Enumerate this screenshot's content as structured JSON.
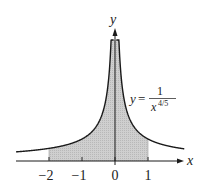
{
  "chart_data": {
    "type": "area",
    "title": "",
    "function": "y = 1/x^(4/5)",
    "equation_label": {
      "lhs": "y",
      "eq": "=",
      "numerator": "1",
      "denominator_base": "x",
      "denominator_exponent": "4/5"
    },
    "xlabel": "x",
    "ylabel": "y",
    "x_ticks": [
      -2,
      -1,
      0,
      1
    ],
    "x_tick_labels": [
      "−2",
      "−1",
      "0",
      "1"
    ],
    "shaded_interval": [
      -2,
      1
    ],
    "xlim": [
      -3,
      2.1
    ],
    "grid": false,
    "legend": "none",
    "colors": {
      "curve": "#1a1a1a",
      "fill": "#c8c8c8",
      "axis": "#1a1a1a"
    }
  }
}
